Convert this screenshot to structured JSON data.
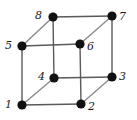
{
  "figure": {
    "kind": "cube-graph-diagram",
    "width": 137,
    "height": 120,
    "background_color": "#ffffff"
  },
  "style": {
    "edge_color_solid": "#5a5a5a",
    "edge_color_light": "#8a8a8a",
    "vertex_color": "#111111",
    "label_color": "#1a1a1a",
    "vertex_radius": 4.6,
    "edge_width": 1.4
  },
  "graph": {
    "vertices": [
      {
        "id": "1",
        "label": "1",
        "x": 22,
        "y": 105,
        "label_x": 5,
        "label_y": 99
      },
      {
        "id": "2",
        "label": "2",
        "x": 81,
        "y": 104,
        "label_x": 88,
        "label_y": 101
      },
      {
        "id": "3",
        "label": "3",
        "x": 112,
        "y": 77,
        "label_x": 119,
        "label_y": 71
      },
      {
        "id": "4",
        "label": "4",
        "x": 54,
        "y": 78,
        "label_x": 38,
        "label_y": 71
      },
      {
        "id": "5",
        "label": "5",
        "x": 22,
        "y": 46,
        "label_x": 5,
        "label_y": 40
      },
      {
        "id": "6",
        "label": "6",
        "x": 80,
        "y": 44,
        "label_x": 87,
        "label_y": 41
      },
      {
        "id": "7",
        "label": "7",
        "x": 112,
        "y": 16,
        "label_x": 119,
        "label_y": 11
      },
      {
        "id": "8",
        "label": "8",
        "x": 53,
        "y": 17,
        "label_x": 35,
        "label_y": 10
      }
    ],
    "edges": [
      {
        "from": "1",
        "to": "2",
        "kind": "horizontal"
      },
      {
        "from": "2",
        "to": "3",
        "kind": "diagonal"
      },
      {
        "from": "3",
        "to": "4",
        "kind": "horizontal"
      },
      {
        "from": "4",
        "to": "1",
        "kind": "diagonal"
      },
      {
        "from": "5",
        "to": "6",
        "kind": "horizontal"
      },
      {
        "from": "6",
        "to": "7",
        "kind": "diagonal"
      },
      {
        "from": "7",
        "to": "8",
        "kind": "horizontal"
      },
      {
        "from": "8",
        "to": "5",
        "kind": "diagonal"
      },
      {
        "from": "1",
        "to": "5",
        "kind": "vertical"
      },
      {
        "from": "2",
        "to": "6",
        "kind": "vertical"
      },
      {
        "from": "3",
        "to": "7",
        "kind": "vertical"
      },
      {
        "from": "4",
        "to": "8",
        "kind": "vertical"
      }
    ]
  }
}
